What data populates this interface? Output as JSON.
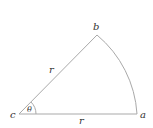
{
  "diagram": {
    "type": "circular-sector",
    "stroke_color": "#a9a9a9",
    "label_color": "#333333",
    "points": {
      "c": {
        "label": "c",
        "x": 19,
        "y": 114
      },
      "a": {
        "label": "a",
        "x": 137,
        "y": 114
      },
      "b": {
        "label": "b",
        "x": 97,
        "y": 35
      }
    },
    "labels": {
      "radius_top": "r",
      "radius_bottom": "r",
      "angle": "θ",
      "vertex_c": "c",
      "vertex_a": "a",
      "vertex_b": "b"
    }
  }
}
